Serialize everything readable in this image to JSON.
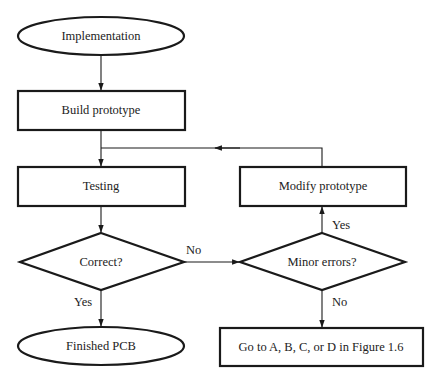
{
  "diagram": {
    "type": "flowchart",
    "colors": {
      "stroke": "#1a1a1a",
      "fill": "#ffffff",
      "text": "#222222"
    },
    "nodes": {
      "implementation": {
        "shape": "ellipse",
        "label": "Implementation"
      },
      "build_prototype": {
        "shape": "rectangle",
        "label": "Build prototype"
      },
      "testing": {
        "shape": "rectangle",
        "label": "Testing"
      },
      "modify_prototype": {
        "shape": "rectangle",
        "label": "Modify prototype"
      },
      "correct": {
        "shape": "diamond",
        "label": "Correct?"
      },
      "minor_errors": {
        "shape": "diamond",
        "label": "Minor errors?"
      },
      "finished_pcb": {
        "shape": "ellipse",
        "label": "Finished PCB"
      },
      "goto_figure": {
        "shape": "rectangle",
        "label": "Go to A, B, C, or D in Figure 1.6"
      }
    },
    "edges": {
      "implementation_to_build": {
        "from": "implementation",
        "to": "build_prototype",
        "label": ""
      },
      "build_to_testing": {
        "from": "build_prototype",
        "to": "testing",
        "label": ""
      },
      "testing_to_correct": {
        "from": "testing",
        "to": "correct",
        "label": ""
      },
      "correct_no": {
        "from": "correct",
        "to": "minor_errors",
        "label": "No"
      },
      "correct_yes": {
        "from": "correct",
        "to": "finished_pcb",
        "label": "Yes"
      },
      "minor_yes": {
        "from": "minor_errors",
        "to": "modify_prototype",
        "label": "Yes"
      },
      "minor_no": {
        "from": "minor_errors",
        "to": "goto_figure",
        "label": "No"
      },
      "modify_to_testing": {
        "from": "modify_prototype",
        "to": "testing",
        "label": ""
      }
    }
  }
}
